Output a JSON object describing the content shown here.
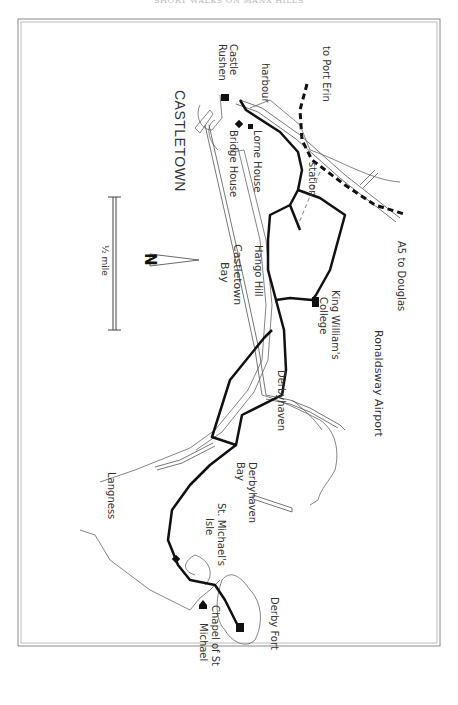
{
  "page": {
    "header": "SHORT WALKS ON MANX HILLS"
  },
  "map": {
    "orientation": "rotated 90° — north arrow points left",
    "north_label": "N",
    "scale_label": "½ mile",
    "labels": {
      "castletown": "CASTLETOWN",
      "castle_rushen": "Castle Rushen",
      "castle": "Castle",
      "rushen": "Rushen",
      "harbour": "harbour",
      "to_port_erin": "to Port Erin",
      "lorne_house": "Lorne House",
      "bridge_house": "Bridge House",
      "station": "station",
      "a5_to_douglas": "A5 to Douglas",
      "hango_hill": "Hango Hill",
      "castletown_bay_1": "Castletown",
      "castletown_bay_2": "Bay",
      "king_williams_1": "King William's",
      "king_williams_2": "College",
      "ronaldsway_airport": "Ronaldsway Airport",
      "derbyhaven": "Derbyhaven",
      "derbyhaven_bay_1": "Derbyhaven",
      "derbyhaven_bay_2": "Bay",
      "langness": "Langness",
      "st_michaels_1": "St. Michael's",
      "st_michaels_2": "Isle",
      "derby_fort": "Derby Fort",
      "chapel_1": "Chapel of St",
      "chapel_2": "Michael"
    },
    "colors": {
      "route": "#111111",
      "road": "#555555",
      "coast": "#666666",
      "frame": "#888888"
    }
  }
}
